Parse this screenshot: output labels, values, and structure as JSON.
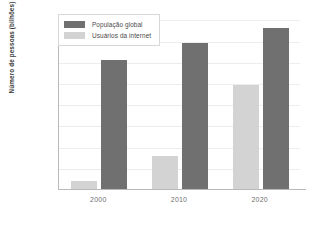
{
  "chart_data": {
    "type": "bar",
    "title": "",
    "subtitle": "",
    "xlabel": "",
    "ylabel": "Número de pessoas (bilhões)",
    "categories": [
      "2000",
      "2010",
      "2020"
    ],
    "series": [
      {
        "name": "População global",
        "color": "#707070",
        "values": [
          6.1,
          6.9,
          7.6
        ]
      },
      {
        "name": "Usuários da internet",
        "color": "#d3d3d3",
        "values": [
          0.4,
          1.55,
          4.9
        ]
      }
    ],
    "ylim": [
      0,
      8.3
    ],
    "yticks": [
      1.0,
      2.0,
      3.0,
      4.0,
      5.0,
      6.0,
      7.0,
      8.0
    ],
    "ytick_labels": [
      "1,0",
      "2,0",
      "3,0",
      "4,0",
      "5,0",
      "6,0",
      "7,0",
      "8,0"
    ],
    "grid": true,
    "grid_axis": "y",
    "legend_position": "top-left-inside",
    "background": "#ffffff",
    "axis_color": "#b9b9b9",
    "grid_color": "#ededed"
  }
}
